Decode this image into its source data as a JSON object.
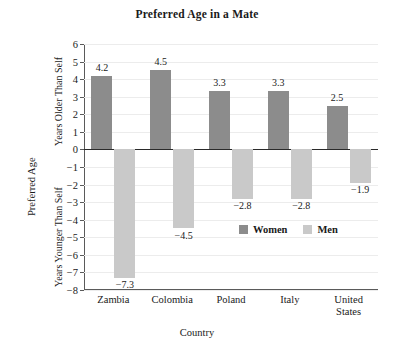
{
  "chart_data": {
    "type": "bar",
    "title": "Preferred Age in a Mate",
    "xlabel": "Country",
    "ylabel": "Preferred Age",
    "ylabel_upper": "Years Older Than Self",
    "ylabel_lower": "Years Younger Than Self",
    "categories": [
      "Zambia",
      "Colombia",
      "Poland",
      "Italy",
      "United\nStates"
    ],
    "series": [
      {
        "name": "Women",
        "color": "#8c8c8c",
        "values": [
          4.2,
          4.5,
          3.3,
          3.3,
          2.5
        ],
        "labels": [
          "4.2",
          "4.5",
          "3.3",
          "3.3",
          "2.5"
        ]
      },
      {
        "name": "Men",
        "color": "#c9c9c9",
        "values": [
          -7.3,
          -4.5,
          -2.8,
          -2.8,
          -1.9
        ],
        "labels": [
          "−7.3",
          "−4.5",
          "−2.8",
          "−2.8",
          "−1.9"
        ]
      }
    ],
    "ylim": [
      -8,
      6
    ],
    "ytick_values": [
      6,
      5,
      4,
      3,
      2,
      1,
      0,
      -1,
      -2,
      -3,
      -4,
      -5,
      -6,
      -7,
      -8
    ],
    "ytick_labels": [
      "6",
      "5",
      "4",
      "3",
      "2",
      "1",
      "0",
      "−1",
      "−2",
      "−3",
      "−4",
      "−5",
      "−6",
      "−7",
      "−8"
    ],
    "grid": true,
    "legend_position": "inside-right-lower",
    "zero_line": 0
  },
  "legend": {
    "items": [
      {
        "label": "Women",
        "swatch": "women"
      },
      {
        "label": "Men",
        "swatch": "men"
      }
    ]
  }
}
